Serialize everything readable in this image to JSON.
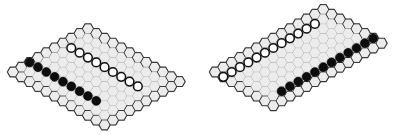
{
  "boards": [
    {
      "name": "board-left",
      "origin": [
        13,
        72
      ],
      "hex_radius": 5.55,
      "size_a": 12,
      "size_b": 10,
      "axis_a": "down-right",
      "axis_b": "up-right",
      "stones": {
        "black": [
          [
            0,
            2
          ],
          [
            1,
            2
          ],
          [
            2,
            2
          ],
          [
            3,
            2
          ],
          [
            4,
            2
          ],
          [
            5,
            2
          ],
          [
            6,
            2
          ],
          [
            7,
            2
          ],
          [
            8,
            2
          ]
        ],
        "white": [
          [
            1,
            6
          ],
          [
            2,
            6
          ],
          [
            3,
            6
          ],
          [
            4,
            6
          ],
          [
            5,
            6
          ],
          [
            6,
            6
          ],
          [
            7,
            6
          ],
          [
            8,
            6
          ],
          [
            9,
            6
          ]
        ]
      }
    },
    {
      "name": "board-right",
      "origin": [
        215,
        72
      ],
      "hex_radius": 5.55,
      "size_a": 8,
      "size_b": 14,
      "axis_a": "down-right",
      "axis_b": "up-right",
      "stones": {
        "white": [
          [
            1,
            0
          ],
          [
            1,
            1
          ],
          [
            1,
            2
          ],
          [
            1,
            3
          ],
          [
            1,
            4
          ],
          [
            1,
            5
          ],
          [
            1,
            6
          ],
          [
            1,
            7
          ],
          [
            1,
            8
          ],
          [
            1,
            9
          ],
          [
            1,
            10
          ],
          [
            1,
            11
          ]
        ],
        "black": [
          [
            6,
            2
          ],
          [
            6,
            3
          ],
          [
            6,
            4
          ],
          [
            6,
            5
          ],
          [
            6,
            6
          ],
          [
            6,
            7
          ],
          [
            6,
            8
          ],
          [
            6,
            9
          ],
          [
            6,
            10
          ],
          [
            6,
            11
          ],
          [
            6,
            12
          ],
          [
            6,
            13
          ]
        ]
      }
    }
  ],
  "colors": {
    "cell_fill": "#ececec",
    "cell_stroke": "#b9b9b9",
    "edge_stroke": "#3a3a3a",
    "black_stone": "#0d0d0d",
    "white_stone": "#ffffff"
  }
}
